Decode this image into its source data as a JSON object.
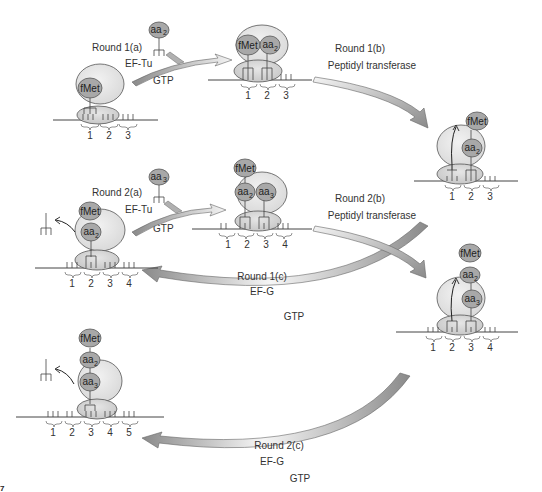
{
  "figure": {
    "figure_number_fragment": "7",
    "colors": {
      "ribosome_large": "#e2e2e2",
      "ribosome_small": "#cfcfcf",
      "aminoacid": "#a9a9a9",
      "arrow_dark": "#8c8c8c",
      "arrow_light": "#f2f2f2",
      "stroke": "#444444"
    }
  },
  "steps": {
    "round1a": {
      "label": "Round 1(a)",
      "factor": "EF-Tu",
      "cofactor": "GTP",
      "incoming": "aa",
      "incoming_sub": "2"
    },
    "round1b": {
      "label": "Round 1(b)",
      "enzyme": "Peptidyl transferase"
    },
    "round1c": {
      "label": "Round 1(c)",
      "factor": "EF-G",
      "cofactor": "GTP"
    },
    "round2a": {
      "label": "Round 2(a)",
      "factor": "EF-Tu",
      "cofactor": "GTP",
      "incoming": "aa",
      "incoming_sub": "3"
    },
    "round2b": {
      "label": "Round 2(b)",
      "enzyme": "Peptidyl transferase"
    },
    "round2c": {
      "label": "Round 2(c)",
      "factor": "EF-G",
      "cofactor": "GTP"
    }
  },
  "molecules": {
    "fmet": "fMet",
    "aa": "aa",
    "sub2": "2",
    "sub3": "3"
  },
  "codons": {
    "c1": "1",
    "c2": "2",
    "c3": "3",
    "c4": "4",
    "c5": "5"
  },
  "states": [
    {
      "id": "s1",
      "description": "Initiation complex: fMet-tRNA in P site, codons 1-3",
      "codons": [
        "1",
        "2",
        "3"
      ]
    },
    {
      "id": "s2",
      "description": "fMet and aa2 tRNAs bound, codons 1-3",
      "codons": [
        "1",
        "2",
        "3"
      ]
    },
    {
      "id": "s3",
      "description": "Peptide bond formed: fMet-aa2 on A-site tRNA, codons 1-3",
      "codons": [
        "1",
        "2",
        "3"
      ]
    },
    {
      "id": "s4",
      "description": "Translocated: fMet-aa2 in P site, empty tRNA released, codons 1-4",
      "codons": [
        "1",
        "2",
        "3",
        "4"
      ]
    },
    {
      "id": "s5",
      "description": "aa2 and aa3 tRNAs bound, codons 1-4",
      "codons": [
        "1",
        "2",
        "3",
        "4"
      ]
    },
    {
      "id": "s6",
      "description": "Peptide bond formed: fMet-aa2-aa3 on A-site tRNA, codons 1-4",
      "codons": [
        "1",
        "2",
        "3",
        "4"
      ]
    },
    {
      "id": "s7",
      "description": "Translocated: fMet-aa2-aa3 in P site, empty tRNA released, codons 1-5",
      "codons": [
        "1",
        "2",
        "3",
        "4",
        "5"
      ]
    }
  ]
}
